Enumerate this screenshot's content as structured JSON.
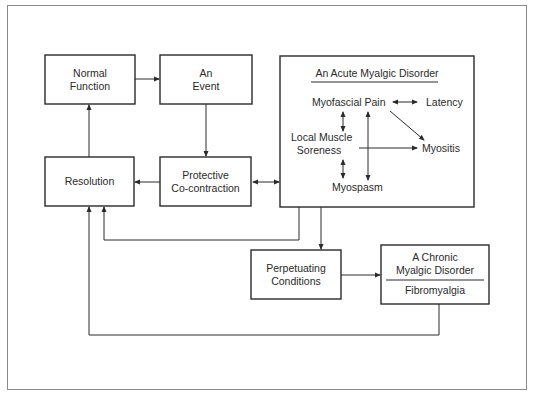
{
  "diagram": {
    "boxes": {
      "normal_function": {
        "line1": "Normal",
        "line2": "Function"
      },
      "an_event": {
        "line1": "An",
        "line2": "Event"
      },
      "resolution": {
        "label": "Resolution"
      },
      "protective": {
        "line1": "Protective",
        "line2": "Co-contraction"
      },
      "acute": {
        "title": "An Acute Myalgic Disorder",
        "items": {
          "myofascial_pain": "Myofascial Pain",
          "latency": "Latency",
          "local_muscle_1": "Local Muscle",
          "local_muscle_2": "Soreness",
          "myositis": "Myositis",
          "myospasm": "Myospasm"
        }
      },
      "perpetuating": {
        "line1": "Perpetuating",
        "line2": "Conditions"
      },
      "chronic": {
        "line1": "A Chronic",
        "line2": "Myalgic Disorder",
        "subtitle": "Fibromyalgia"
      }
    },
    "colors": {
      "stroke": "#2a2a2a",
      "frame": "#8a8a8a",
      "background": "#ffffff"
    }
  }
}
